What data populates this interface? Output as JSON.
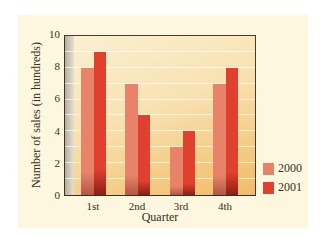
{
  "chart_data": {
    "type": "bar",
    "title": "",
    "xlabel": "Quarter",
    "ylabel": "Number of sales (in hundreds)",
    "categories": [
      "1st",
      "2nd",
      "3rd",
      "4th"
    ],
    "series": [
      {
        "name": "2000",
        "values": [
          8,
          7,
          3,
          7
        ],
        "color": "#E8836A"
      },
      {
        "name": "2001",
        "values": [
          9,
          5,
          4,
          8
        ],
        "color": "#E0402E"
      }
    ],
    "ylim": [
      0,
      10
    ],
    "yticks": [
      "0",
      "2",
      "4",
      "6",
      "8",
      "10"
    ],
    "grid": true,
    "legend_position": "right"
  },
  "legend": {
    "items": [
      {
        "label": "2000",
        "color": "#E8836A"
      },
      {
        "label": "2001",
        "color": "#E0402E"
      }
    ]
  }
}
